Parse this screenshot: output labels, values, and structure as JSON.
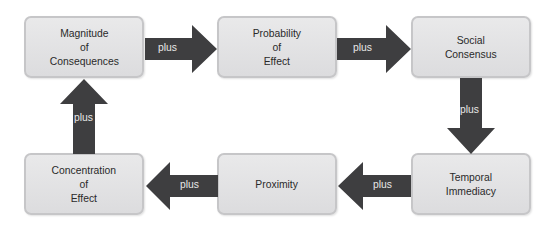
{
  "diagram": {
    "title": "",
    "nodes": [
      {
        "id": "magnitude",
        "label": "Magnitude\nof\nConsequences"
      },
      {
        "id": "probability",
        "label": "Probability\nof\nEffect"
      },
      {
        "id": "consensus",
        "label": "Social\nConsensus"
      },
      {
        "id": "temporal",
        "label": "Temporal\nImmediacy"
      },
      {
        "id": "proximity",
        "label": "Proximity"
      },
      {
        "id": "concentration",
        "label": "Concentration\nof\nEffect"
      }
    ],
    "edges": [
      {
        "from": "magnitude",
        "to": "probability",
        "label": "plus"
      },
      {
        "from": "probability",
        "to": "consensus",
        "label": "plus"
      },
      {
        "from": "consensus",
        "to": "temporal",
        "label": "plus"
      },
      {
        "from": "temporal",
        "to": "proximity",
        "label": "plus"
      },
      {
        "from": "proximity",
        "to": "concentration",
        "label": "plus"
      },
      {
        "from": "concentration",
        "to": "magnitude",
        "label": "plus"
      }
    ],
    "colors": {
      "box_fill": "#e2e2e4",
      "box_border": "#c6c6c8",
      "arrow": "#3e3e40",
      "arrow_text": "#e8e8e8",
      "box_text": "#2a2a2a"
    }
  }
}
